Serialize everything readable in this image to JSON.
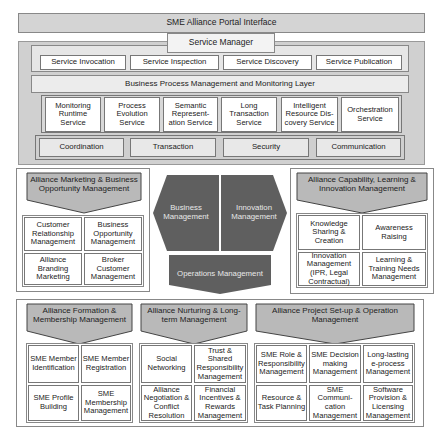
{
  "portal": {
    "title": "SME Alliance Portal Interface"
  },
  "service_manager": {
    "title": "Service Manager",
    "services": [
      "Service Invocation",
      "Service Inspection",
      "Service Discovery",
      "Service Publication"
    ]
  },
  "bpm_layer": {
    "title": "Business Process Management and Monitoring Layer",
    "services": [
      "Monitoring Runtime Service",
      "Process Evolution Service",
      "Semantic Represent-ation Service",
      "Long Transaction Service",
      "Intelligent Resource Dis-covery Service",
      "Orchestration Service"
    ],
    "infrastructure": [
      "Coordination",
      "Transaction",
      "Security",
      "Communication"
    ]
  },
  "core": {
    "business": "Business Management",
    "innovation": "Innovation Management",
    "operations": "Operations Management"
  },
  "marketing": {
    "title": "Alliance Marketing & Business Opportunity Management",
    "cells": [
      "Customer Relationship Management",
      "Business Opportunity Management",
      "Alliance Branding Marketing",
      "Broker Customer Management"
    ]
  },
  "capability": {
    "title": "Alliance Capability, Learning & Innovation Management",
    "cells": [
      "Knowledge Sharing & Creation",
      "Awareness Raising",
      "Innovation Management (IPR, Legal Contractual)",
      "Learning & Training Needs Management"
    ]
  },
  "formation": {
    "title": "Alliance Formation & Membership Management",
    "cells": [
      "SME Member Identification",
      "SME Member Registration",
      "SME Profile Building",
      "SME Membership Management"
    ]
  },
  "nurturing": {
    "title": "Alliance Nurturing & Long-term Management",
    "cells": [
      "Social Networking",
      "Trust & Shared Responsibility Management",
      "Alliance Negotiation & Conflict Resolution",
      "Financial Incentives & Rewards Management"
    ]
  },
  "project": {
    "title": "Alliance Project Set-up & Operation Management",
    "cells": [
      "SME Role & Responsibility Management",
      "SME Decision making Management",
      "Long-lasting e-process Management",
      "Resource & Task Planning",
      "SME Communi-cation Management",
      "Software Provision & Licensing Management"
    ]
  },
  "colors": {
    "header_fill": "#b9b9b9",
    "core_fill": "#5f5f5f",
    "panel_fill": "#d0d0d0"
  }
}
